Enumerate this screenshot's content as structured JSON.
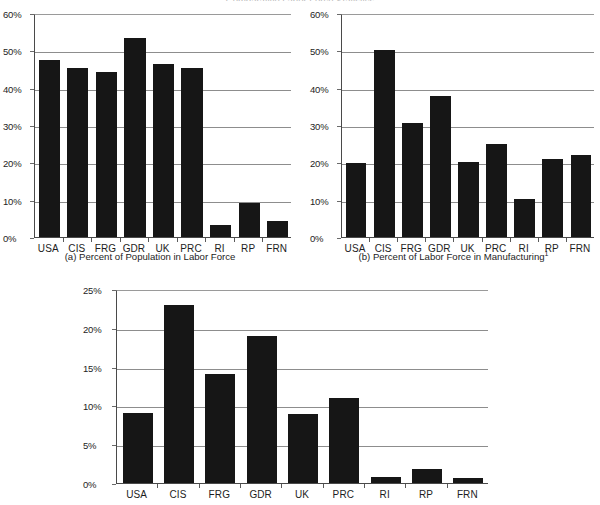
{
  "figure": {
    "title_fragment": "Comparative Labor Force Statistics",
    "categories": [
      "USA",
      "CIS",
      "FRG",
      "GDR",
      "UK",
      "PRC",
      "RI",
      "RP",
      "FRN"
    ]
  },
  "chart_data": [
    {
      "id": "chart-a",
      "type": "bar",
      "title": "",
      "caption": "(a) Percent of Population in Labor Force",
      "caption_footnote": "",
      "categories": [
        "USA",
        "CIS",
        "FRG",
        "GDR",
        "UK",
        "PRC",
        "RI",
        "RP",
        "FRN"
      ],
      "values": [
        47.5,
        45.3,
        44.3,
        53.3,
        46.3,
        45.3,
        3.2,
        9.2,
        4.2
      ],
      "xlabel": "",
      "ylabel": "",
      "ylim": [
        0,
        60
      ],
      "yticks": [
        0,
        10,
        20,
        30,
        40,
        50,
        60
      ],
      "ytick_labels": [
        "0%",
        "10%",
        "20%",
        "30%",
        "40%",
        "50%",
        "60%"
      ],
      "grid": true,
      "legend": "none"
    },
    {
      "id": "chart-b",
      "type": "bar",
      "title": "",
      "caption": "(b) Percent of Labor Force in Manufacturing",
      "caption_footnote": "1",
      "categories": [
        "USA",
        "CIS",
        "FRG",
        "GDR",
        "UK",
        "PRC",
        "RI",
        "RP",
        "FRN"
      ],
      "values": [
        19.7,
        50.2,
        30.5,
        37.8,
        20.0,
        25.0,
        10.1,
        21.0,
        22.0
      ],
      "xlabel": "",
      "ylabel": "",
      "ylim": [
        0,
        60
      ],
      "yticks": [
        0,
        10,
        20,
        30,
        40,
        50,
        60
      ],
      "ytick_labels": [
        "0%",
        "10%",
        "20%",
        "30%",
        "40%",
        "50%",
        "60%"
      ],
      "grid": true,
      "legend": "none"
    },
    {
      "id": "chart-c",
      "type": "bar",
      "title": "",
      "caption": "",
      "caption_footnote": "",
      "categories": [
        "USA",
        "CIS",
        "FRG",
        "GDR",
        "UK",
        "PRC",
        "RI",
        "RP",
        "FRN"
      ],
      "values": [
        9.0,
        23.0,
        14.0,
        19.0,
        8.9,
        10.9,
        0.8,
        1.8,
        0.7
      ],
      "xlabel": "",
      "ylabel": "",
      "ylim": [
        0,
        25
      ],
      "yticks": [
        0,
        5,
        10,
        15,
        20,
        25
      ],
      "ytick_labels": [
        "0%",
        "5%",
        "10%",
        "15%",
        "20%",
        "25%"
      ],
      "grid": true,
      "legend": "none"
    }
  ],
  "colors": {
    "bar": "#161616",
    "grid": "#8d8d8d",
    "axis": "#4a4a4a",
    "text": "#1d1d1d"
  }
}
